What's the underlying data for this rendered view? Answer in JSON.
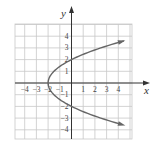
{
  "chart_data": {
    "type": "line",
    "title": "",
    "xlabel": "x",
    "ylabel": "y",
    "xlim": [
      -4.8,
      5.1
    ],
    "ylim": [
      -4.8,
      5.0
    ],
    "grid": true,
    "legend": null,
    "x_ticks": [
      -4,
      -3,
      -2,
      -1,
      1,
      2,
      3,
      4
    ],
    "y_ticks": [
      4,
      3,
      2,
      1,
      -1,
      -2,
      -3,
      -4
    ],
    "x_tick_labels": [
      "−4",
      "−3",
      "−2",
      "−1",
      "1",
      "2",
      "3",
      "4"
    ],
    "y_tick_labels": [
      "4",
      "3",
      "2",
      "1",
      "−1",
      "−2",
      "−3",
      "−4"
    ],
    "series": [
      {
        "name": "x = y²/2 − 2",
        "description": "Sideways parabola opening right, vertex (−2, 0), y-intercepts at ±2, arrows on both ends",
        "points": [
          {
            "x": 4.2,
            "y": 3.6
          },
          {
            "x": 2.5,
            "y": 3.0
          },
          {
            "x": 0.0,
            "y": 2.0
          },
          {
            "x": -1.5,
            "y": 1.0
          },
          {
            "x": -2.0,
            "y": 0.0
          },
          {
            "x": -1.5,
            "y": -1.0
          },
          {
            "x": 0.0,
            "y": -2.0
          },
          {
            "x": 2.5,
            "y": -3.0
          },
          {
            "x": 4.2,
            "y": -3.6
          }
        ],
        "color": "#666666"
      }
    ]
  },
  "labels": {
    "x_axis": "x",
    "y_axis": "y"
  }
}
